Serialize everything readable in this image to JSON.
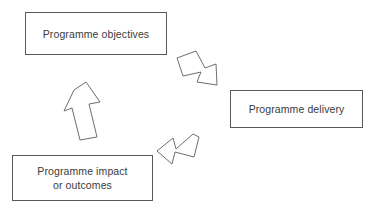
{
  "diagram": {
    "type": "cycle",
    "background_color": "#ffffff",
    "node_border_color": "#555a5e",
    "node_fill_color": "#ffffff",
    "arrow_stroke_color": "#6a6f74",
    "arrow_fill_color": "#ffffff",
    "text_color": "#3a3a3a",
    "nodes": [
      {
        "id": "objectives",
        "label": "Programme objectives",
        "position": "top-left"
      },
      {
        "id": "delivery",
        "label": "Programme delivery",
        "position": "middle-right"
      },
      {
        "id": "impact",
        "label": "Programme impact\nor outcomes",
        "position": "bottom-left"
      }
    ],
    "arrows": [
      {
        "id": "objectives-to-delivery",
        "from": "objectives",
        "to": "delivery",
        "direction": "down-right",
        "style": "block-outline"
      },
      {
        "id": "delivery-to-impact",
        "from": "delivery",
        "to": "impact",
        "direction": "down-left",
        "style": "block-outline"
      },
      {
        "id": "impact-to-objectives",
        "from": "impact",
        "to": "objectives",
        "direction": "up",
        "style": "block-outline"
      }
    ]
  }
}
